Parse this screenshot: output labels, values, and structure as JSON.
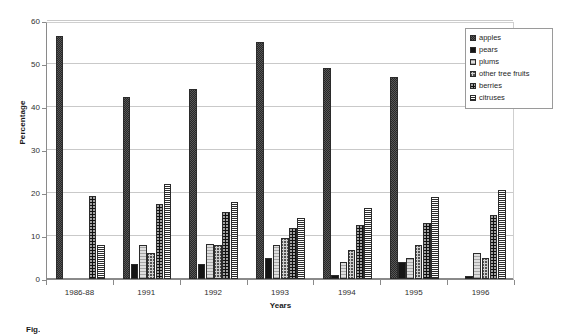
{
  "chart_data": {
    "type": "bar",
    "title": "",
    "xlabel": "Years",
    "ylabel": "Percentage",
    "ylim": [
      0,
      60
    ],
    "ytick_values": [
      0,
      10,
      20,
      30,
      40,
      50,
      60
    ],
    "ytick_labels": [
      "0",
      "10",
      "20",
      "30",
      "40",
      "50",
      "60"
    ],
    "grid": true,
    "legend_position": "upper right",
    "categories": [
      "1986-88",
      "1991",
      "1992",
      "1993",
      "1994",
      "1995",
      "1996"
    ],
    "series": [
      {
        "name": "apples",
        "pattern": "dense-diagonal-crosshatch",
        "values": [
          56.5,
          42.3,
          44.3,
          55.2,
          49.0,
          47.0,
          0
        ]
      },
      {
        "name": "pears",
        "pattern": "solid-black",
        "values": [
          0,
          3.5,
          3.6,
          5.0,
          1.0,
          4.0,
          0.8
        ]
      },
      {
        "name": "plums",
        "pattern": "horizontal-light",
        "values": [
          0,
          8.0,
          8.2,
          8.0,
          4.0,
          5.0,
          6.0
        ]
      },
      {
        "name": "other tree fruits",
        "pattern": "diagonal-crosshatch",
        "values": [
          0,
          6.0,
          8.0,
          9.5,
          6.8,
          8.0,
          5.0
        ]
      },
      {
        "name": "berries",
        "pattern": "black-dotted",
        "values": [
          19.3,
          17.5,
          15.5,
          11.8,
          12.5,
          13.0,
          15.0
        ]
      },
      {
        "name": "citruses",
        "pattern": "horizontal-dense",
        "values": [
          8.0,
          22.0,
          17.8,
          14.2,
          16.5,
          19.0,
          20.7
        ]
      }
    ]
  },
  "legend": {
    "items": [
      {
        "label": "apples"
      },
      {
        "label": "pears"
      },
      {
        "label": "plums"
      },
      {
        "label": "other tree fruits"
      },
      {
        "label": "berries"
      },
      {
        "label": "citruses"
      }
    ]
  },
  "axes": {
    "y_title": "Percentage",
    "x_title": "Years"
  },
  "caption": {
    "text": "Fig."
  }
}
